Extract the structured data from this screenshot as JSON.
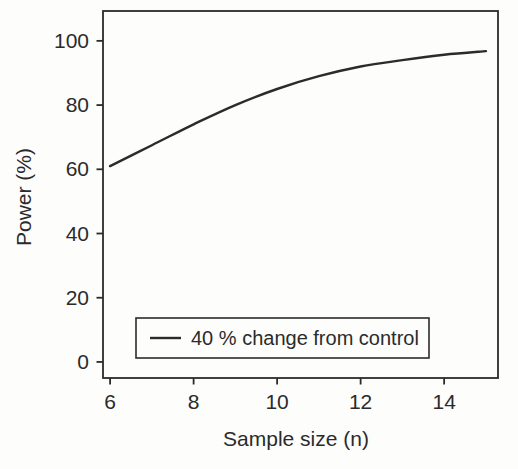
{
  "figure": {
    "background": "#fdfdfc",
    "ink_color": "#2b2b2b"
  },
  "chart_data": {
    "type": "line",
    "title": "",
    "xlabel": "Sample size (n)",
    "ylabel": "Power (%)",
    "x": [
      6,
      7,
      8,
      9,
      10,
      11,
      12,
      13,
      14,
      15
    ],
    "series": [
      {
        "name": "40 % change from control",
        "values": [
          61,
          67.5,
          74,
          80,
          85,
          89,
          92,
          94,
          95.7,
          96.8
        ],
        "color": "#2b2b2b"
      }
    ],
    "xticks": [
      6,
      8,
      10,
      12,
      14
    ],
    "yticks": [
      0,
      20,
      40,
      60,
      80,
      100
    ],
    "xlim": [
      5.83,
      15.29
    ],
    "ylim": [
      -5,
      109.3
    ],
    "grid": false,
    "legend_position": "inside-bottom-left"
  }
}
